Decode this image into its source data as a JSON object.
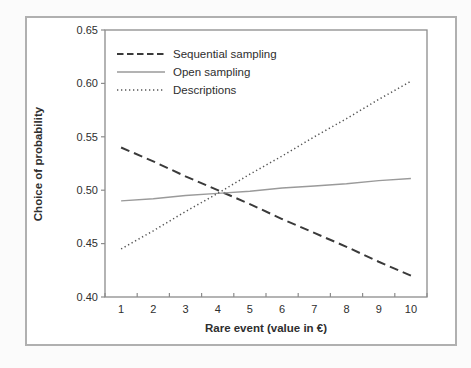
{
  "style": {
    "page_background": "#fbfbfb",
    "figure_background": "#ffffff",
    "frame_border_color": "#b0b0b0",
    "axis_color": "#8c8c8c",
    "text_color": "#2e2e2e"
  },
  "chart_data": {
    "type": "line",
    "title": "",
    "xlabel": "Rare event (value in €)",
    "ylabel": "Choice of probability",
    "x": [
      1,
      2,
      3,
      4,
      5,
      6,
      7,
      8,
      9,
      10
    ],
    "ylim": [
      0.4,
      0.65
    ],
    "yticks": [
      0.4,
      0.45,
      0.5,
      0.55,
      0.6,
      0.65
    ],
    "ytick_labels": [
      "0.40",
      "0.45",
      "0.50",
      "0.55",
      "0.60",
      "0.65"
    ],
    "xtick_style": "between-categories",
    "grid": false,
    "legend_position": "top-left-inside",
    "series": [
      {
        "name": "Sequential sampling",
        "style": "dashed",
        "color": "#3a3a3a",
        "values": [
          0.54,
          0.527,
          0.513,
          0.5,
          0.487,
          0.473,
          0.46,
          0.447,
          0.433,
          0.42
        ]
      },
      {
        "name": "Open sampling",
        "style": "solid",
        "color": "#9a9a9a",
        "values": [
          0.49,
          0.492,
          0.495,
          0.497,
          0.499,
          0.502,
          0.504,
          0.506,
          0.509,
          0.511
        ]
      },
      {
        "name": "Descriptions",
        "style": "dotted",
        "color": "#555555",
        "values": [
          0.445,
          0.462,
          0.48,
          0.497,
          0.515,
          0.532,
          0.55,
          0.567,
          0.585,
          0.602
        ]
      }
    ]
  }
}
